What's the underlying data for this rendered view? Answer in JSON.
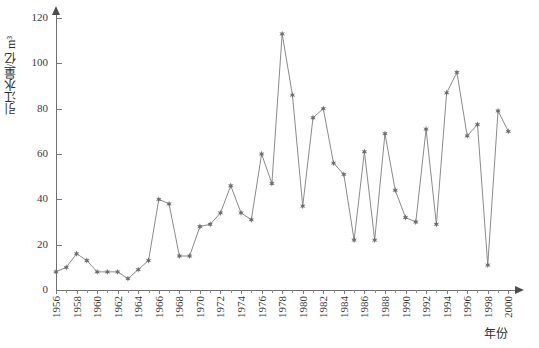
{
  "chart_data": {
    "type": "line",
    "title": "",
    "xlabel": "年份",
    "ylabel": "引江水量/亿 m³",
    "xlim": [
      1955,
      2001
    ],
    "ylim": [
      0,
      125
    ],
    "yticks": [
      0,
      20,
      40,
      60,
      80,
      100,
      120
    ],
    "xticks": [
      1956,
      1958,
      1960,
      1962,
      1964,
      1966,
      1968,
      1970,
      1972,
      1974,
      1976,
      1978,
      1980,
      1982,
      1984,
      1986,
      1988,
      1990,
      1992,
      1994,
      1996,
      1998,
      2000
    ],
    "grid": false,
    "legend": null,
    "marker": "star",
    "line_color": "#8a8a8a",
    "marker_color": "#6d6d6d",
    "x": [
      1956,
      1957,
      1958,
      1959,
      1960,
      1961,
      1962,
      1963,
      1964,
      1965,
      1966,
      1967,
      1968,
      1969,
      1970,
      1971,
      1972,
      1973,
      1974,
      1975,
      1976,
      1977,
      1978,
      1979,
      1980,
      1981,
      1982,
      1983,
      1984,
      1985,
      1986,
      1987,
      1988,
      1989,
      1990,
      1991,
      1992,
      1993,
      1994,
      1995,
      1996,
      1997,
      1998,
      1999,
      2000
    ],
    "values": [
      8,
      10,
      16,
      13,
      8,
      8,
      8,
      5,
      9,
      13,
      40,
      38,
      15,
      15,
      28,
      29,
      34,
      46,
      34,
      31,
      60,
      47,
      113,
      86,
      37,
      76,
      80,
      56,
      51,
      22,
      61,
      22,
      69,
      44,
      32,
      30,
      71,
      29,
      87,
      96,
      68,
      73,
      11,
      79,
      70
    ]
  }
}
